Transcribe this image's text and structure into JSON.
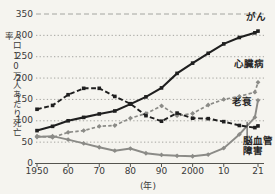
{
  "chart_data": {
    "type": "line",
    "title": "",
    "ylabel": "人口10万人あたり死亡率",
    "xlabel": "(年)",
    "x": [
      1950,
      1955,
      1960,
      1965,
      1970,
      1975,
      1980,
      1985,
      1990,
      1995,
      2000,
      2005,
      2010,
      2015,
      2020,
      2021
    ],
    "xtick_labels": [
      {
        "year": 1950,
        "label": "1950"
      },
      {
        "year": 1960,
        "label": "60"
      },
      {
        "year": 1970,
        "label": "70"
      },
      {
        "year": 1980,
        "label": "80"
      },
      {
        "year": 1990,
        "label": "90"
      },
      {
        "year": 2000,
        "label": "2000"
      },
      {
        "year": 2010,
        "label": "10"
      },
      {
        "year": 2021,
        "label": "21"
      }
    ],
    "yticks": [
      0,
      50,
      100,
      150,
      200,
      250,
      300,
      350
    ],
    "ylim": [
      0,
      350
    ],
    "xlim": [
      1950,
      2021
    ],
    "grid": "dotted-horizontal",
    "legend_position": "labels-at-line-ends",
    "series": [
      {
        "name": "cancer",
        "label": "がん",
        "color": "#1f1f1f",
        "line": "solid",
        "dash": "",
        "stroke_width": 2.1,
        "marker": "square",
        "values": [
          77,
          87,
          100,
          108,
          116,
          123,
          139,
          156,
          177,
          211,
          235,
          258,
          280,
          295,
          306,
          310
        ]
      },
      {
        "name": "heart-disease",
        "label": "心臓病",
        "color": "#8b8b87",
        "line": "dashed",
        "dash": "3.4,2.2",
        "stroke_width": 1.7,
        "marker": "diamond",
        "values": [
          64,
          61,
          73,
          77,
          87,
          89,
          106,
          117,
          135,
          112,
          117,
          137,
          150,
          157,
          167,
          190
        ]
      },
      {
        "name": "senility",
        "label": "老衰",
        "color": "#8b8b87",
        "line": "solid",
        "dash": "",
        "stroke_width": 1.9,
        "marker": "diamond",
        "values": [
          62,
          64,
          56,
          47,
          38,
          30,
          35,
          24,
          20,
          18,
          17,
          21,
          36,
          68,
          108,
          148
        ]
      },
      {
        "name": "cerebrovascular-disease",
        "label": "脳血管\n障害",
        "color": "#1f1f1f",
        "line": "dashed",
        "dash": "4.8,2.6",
        "stroke_width": 1.9,
        "marker": "square",
        "values": [
          127,
          136,
          161,
          176,
          176,
          157,
          140,
          112,
          99,
          118,
          106,
          105,
          98,
          89,
          84,
          88
        ]
      }
    ],
    "colors": {
      "background": "#f5f4ef",
      "grid": "#9c9c97",
      "axis": "#55544f",
      "text": "#3a3a3a"
    }
  }
}
